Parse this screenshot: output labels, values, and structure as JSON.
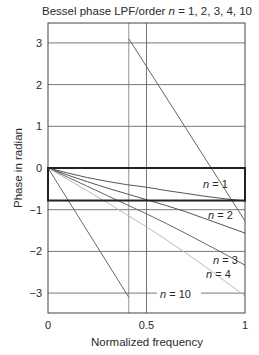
{
  "chart_data": {
    "type": "line",
    "title": "Bessel phase LPF/order n = 1, 2, 3, 4, 10",
    "title_parts": {
      "prefix": "Bessel phase LPF/order ",
      "var": "n",
      "suffix": " = 1, 2, 3, 4, 10"
    },
    "xlabel": "Normalized frequency",
    "ylabel": "Phase in radian",
    "xlim": [
      0,
      1
    ],
    "ylim": [
      -3.5,
      3.5
    ],
    "x_ticks": [
      0,
      0.5,
      1
    ],
    "x_tick_labels": [
      "0",
      "0.5",
      "1"
    ],
    "y_ticks": [
      3,
      2,
      1,
      0,
      -1,
      -2,
      -3
    ],
    "y_tick_labels": [
      "3",
      "2",
      "1",
      "0",
      "−1",
      "−2",
      "−3"
    ],
    "grid": true,
    "series": [
      {
        "name": "n = 1",
        "x": [
          0,
          0.1,
          0.2,
          0.3,
          0.4,
          0.5,
          0.6,
          0.7,
          0.8,
          0.9,
          1.0
        ],
        "values": [
          0,
          -0.12,
          -0.23,
          -0.32,
          -0.4,
          -0.46,
          -0.54,
          -0.61,
          -0.68,
          -0.74,
          -0.79
        ],
        "color": "#555555"
      },
      {
        "name": "n = 2",
        "x": [
          0,
          0.1,
          0.2,
          0.3,
          0.4,
          0.5,
          0.6,
          0.7,
          0.8,
          0.9,
          1.0
        ],
        "values": [
          0,
          -0.17,
          -0.33,
          -0.48,
          -0.62,
          -0.76,
          -0.9,
          -1.05,
          -1.22,
          -1.39,
          -1.56
        ],
        "color": "#555555"
      },
      {
        "name": "n = 3",
        "x": [
          0,
          0.1,
          0.2,
          0.3,
          0.4,
          0.5,
          0.6,
          0.7,
          0.8,
          0.9,
          1.0
        ],
        "values": [
          0,
          -0.22,
          -0.44,
          -0.66,
          -0.88,
          -1.1,
          -1.33,
          -1.57,
          -1.82,
          -2.07,
          -2.33
        ],
        "color": "#666666"
      },
      {
        "name": "n = 4",
        "x": [
          0,
          0.1,
          0.2,
          0.3,
          0.4,
          0.5,
          0.6,
          0.7,
          0.8,
          0.9,
          1.0
        ],
        "values": [
          0,
          -0.27,
          -0.55,
          -0.83,
          -1.12,
          -1.41,
          -1.72,
          -2.04,
          -2.37,
          -2.72,
          -3.07
        ],
        "color": "#bbbbbb"
      },
      {
        "name": "n = 10",
        "x": [
          0,
          0.41,
          0.41,
          1.0
        ],
        "values": [
          0,
          -3.1,
          3.1,
          -1.27
        ],
        "color": "#666666",
        "note": "phase wraps at ~0.41"
      }
    ],
    "annotations": [
      {
        "text": "n = 1",
        "x": 0.82,
        "y": -0.55
      },
      {
        "text": "n = 2",
        "x": 0.82,
        "y": -1.05
      },
      {
        "text": "n = 3",
        "x": 0.82,
        "y": -2.2
      },
      {
        "text": "n = 4",
        "x": 0.8,
        "y": -2.5
      },
      {
        "text": "n = 10",
        "x": 0.57,
        "y": -3.0
      }
    ],
    "highlight_box": {
      "x0": 0,
      "x1": 1,
      "y0": 0,
      "y1": -0.78
    },
    "extra_vertical_line_x": 0.41
  }
}
